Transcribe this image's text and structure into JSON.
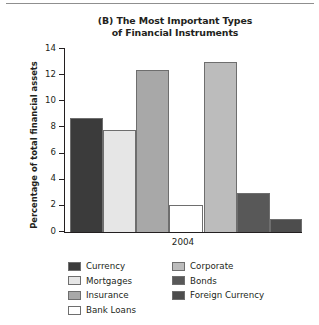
{
  "chart_data": {
    "type": "bar",
    "title": "(B) The Most Important Types of Financial Instruments",
    "title_line1": "(B) The Most Important Types",
    "title_line2": "of Financial Instruments",
    "xlabel": "2004",
    "ylabel": "Percentage of total financial assets",
    "categories": [
      "Currency",
      "Mortgages",
      "Insurance",
      "Bank Loans",
      "Corporate",
      "Bonds",
      "Foreign Currency"
    ],
    "values": [
      8.7,
      7.8,
      12.4,
      2.1,
      13.0,
      3.0,
      1.0
    ],
    "colors": [
      "#3b3b3b",
      "#e6e6e6",
      "#a8a8a8",
      "#ffffff",
      "#bcbcbc",
      "#585858",
      "#4d4d4d"
    ],
    "ylim": [
      0,
      14
    ],
    "yticks": [
      0,
      2,
      4,
      6,
      8,
      10,
      12,
      14
    ],
    "ytick_labels": [
      "0",
      "2",
      "4",
      "6",
      "8",
      "10",
      "12",
      "14"
    ],
    "grid": false,
    "legend_position": "bottom"
  },
  "legend": {
    "column1": [
      {
        "label": "Currency",
        "color": "#3b3b3b"
      },
      {
        "label": "Mortgages",
        "color": "#e6e6e6"
      },
      {
        "label": "Insurance",
        "color": "#a8a8a8"
      },
      {
        "label": "Bank Loans",
        "color": "#ffffff"
      }
    ],
    "column2": [
      {
        "label": "Corporate",
        "color": "#bcbcbc"
      },
      {
        "label": "Bonds",
        "color": "#585858"
      },
      {
        "label": "Foreign Currency",
        "color": "#4d4d4d"
      }
    ]
  }
}
